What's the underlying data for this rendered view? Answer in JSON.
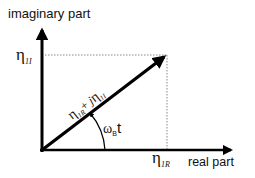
{
  "diagram": {
    "type": "phasor",
    "y_axis_label": "imaginary part",
    "x_axis_label": "real part",
    "imag_value": {
      "symbol": "η",
      "subscript": "1I"
    },
    "real_value": {
      "symbol": "η",
      "subscript": "1R"
    },
    "vector_label": {
      "real": "η",
      "real_sub": "1R",
      "plus": "+ ",
      "j": "j",
      "imag": "η",
      "imag_sub": "1I"
    },
    "angle_label": {
      "symbol": "ω",
      "subscript": "B",
      "var": "t"
    },
    "colors": {
      "line": "#000000",
      "guide": "#888888",
      "text": "#111111"
    }
  }
}
